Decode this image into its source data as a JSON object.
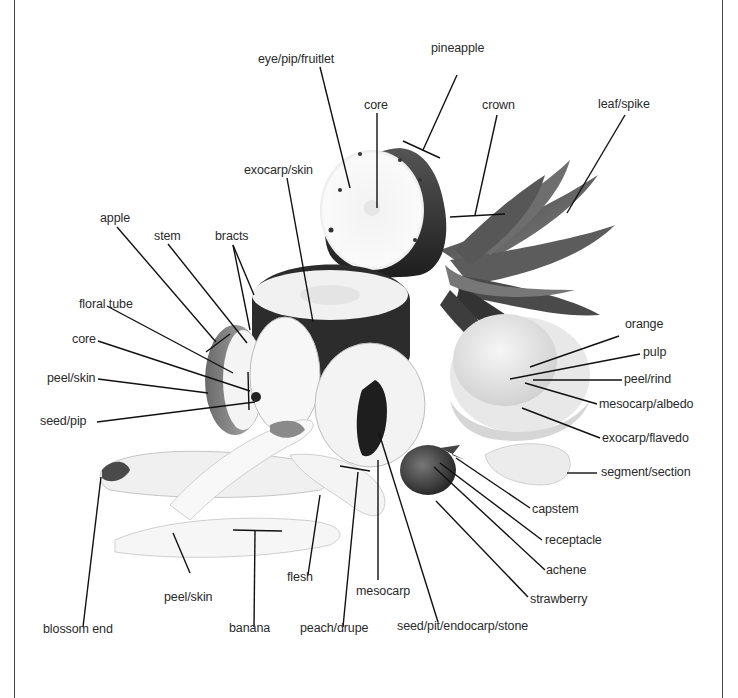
{
  "diagram": {
    "fruits": [
      "pineapple",
      "apple",
      "orange",
      "banana",
      "peach/drupe",
      "strawberry"
    ],
    "labels": {
      "eye_pip_fruitlet": "eye/pip/fruitlet",
      "pineapple": "pineapple",
      "core_pineapple": "core",
      "crown": "crown",
      "leaf_spike": "leaf/spike",
      "exocarp_skin": "exocarp/skin",
      "apple": "apple",
      "stem": "stem",
      "bracts": "bracts",
      "floral_tube": "floral tube",
      "core_apple": "core",
      "peel_skin_apple": "peel/skin",
      "seed_pip": "seed/pip",
      "orange": "orange",
      "pulp": "pulp",
      "peel_rind": "peel/rind",
      "mesocarp_albedo": "mesocarp/albedo",
      "exocarp_flavedo": "exocarp/flavedo",
      "segment_section": "segment/section",
      "capstem": "capstem",
      "receptacle": "receptacle",
      "achene": "achene",
      "strawberry": "strawberry",
      "flesh": "flesh",
      "mesocarp": "mesocarp",
      "peel_skin_banana": "peel/skin",
      "blossom_end": "blossom end",
      "banana": "banana",
      "peach_drupe": "peach/drupe",
      "seed_pit": "seed/pit/endocarp/stone"
    }
  }
}
